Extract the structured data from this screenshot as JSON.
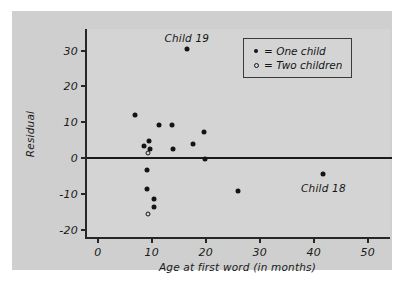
{
  "chart_data": {
    "type": "scatter",
    "title": "",
    "xlabel": "Age at first word (in months)",
    "ylabel": "Residual",
    "xlim": [
      -2,
      54.5
    ],
    "ylim": [
      -22.5,
      36
    ],
    "xticks": [
      0,
      10,
      20,
      30,
      40,
      50
    ],
    "xticklabels": [
      "0",
      "10",
      "20",
      "30",
      "40",
      "50"
    ],
    "yticks": [
      30,
      20,
      10,
      0,
      -10,
      -20
    ],
    "yticklabels": [
      "30",
      "20",
      "10",
      "0",
      "-10",
      "-20"
    ],
    "grid": false,
    "reference_line": {
      "axis": "y",
      "value": 0
    },
    "legend": {
      "position": "top-right",
      "entries": [
        {
          "marker": "filled-dot",
          "label": "= One child"
        },
        {
          "marker": "open-circle",
          "label": "= Two children"
        }
      ]
    },
    "annotations": [
      {
        "text": "Child 19",
        "x": 16.5,
        "y": 33.2
      },
      {
        "text": "Child 18",
        "x": 41.8,
        "y": -8.6
      }
    ],
    "series": [
      {
        "name": "One child",
        "marker": "filled-dot",
        "points": [
          {
            "x": 6.8,
            "y": 12.0
          },
          {
            "x": 8.6,
            "y": 3.4
          },
          {
            "x": 9.5,
            "y": 4.8
          },
          {
            "x": 9.6,
            "y": 2.7
          },
          {
            "x": 11.3,
            "y": 9.2
          },
          {
            "x": 13.8,
            "y": 9.2
          },
          {
            "x": 13.9,
            "y": 2.6
          },
          {
            "x": 16.5,
            "y": 30.5
          },
          {
            "x": 17.6,
            "y": 4.0
          },
          {
            "x": 19.6,
            "y": 7.2
          },
          {
            "x": 19.8,
            "y": -0.3
          },
          {
            "x": 9.2,
            "y": -3.4
          },
          {
            "x": 9.1,
            "y": -8.5
          },
          {
            "x": 10.4,
            "y": -11.3
          },
          {
            "x": 10.5,
            "y": -13.5
          },
          {
            "x": 25.9,
            "y": -9.0
          },
          {
            "x": 41.8,
            "y": -4.5
          }
        ]
      },
      {
        "name": "Two children",
        "marker": "open-circle",
        "points": [
          {
            "x": 9.3,
            "y": 1.4
          },
          {
            "x": 9.3,
            "y": -15.5
          }
        ]
      }
    ]
  },
  "colors": {
    "figure_background": "#ffffff",
    "panel_background": "#cfcfcf",
    "plot_background": "#d4d4d4",
    "axis": "#262626",
    "marker": "#141414",
    "text": "#1a1a1a"
  }
}
